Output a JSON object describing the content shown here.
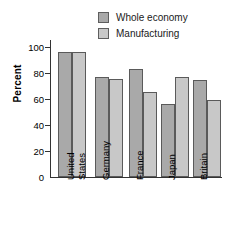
{
  "chart_data": {
    "type": "bar",
    "title": "",
    "xlabel": "",
    "ylabel": "Percent",
    "ylim": [
      0,
      110
    ],
    "yticks": [
      0,
      20,
      40,
      60,
      80,
      100
    ],
    "ytick_labels": [
      "0",
      "20",
      "40",
      "60",
      "80",
      "100"
    ],
    "grid": false,
    "legend_position": "top-right",
    "categories": [
      "United States",
      "Germany",
      "France",
      "Japan",
      "Britain"
    ],
    "category_label_lines": [
      [
        "United",
        "States"
      ],
      [
        "Germany"
      ],
      [
        "France"
      ],
      [
        "Japan"
      ],
      [
        "Britain"
      ]
    ],
    "series": [
      {
        "name": "Whole economy",
        "color": "#a9a9a9",
        "values": [
          100,
          80,
          87,
          59,
          77.5
        ]
      },
      {
        "name": "Manufacturing",
        "color": "#c8c8c8",
        "values": [
          100,
          78.5,
          68,
          80,
          62
        ]
      }
    ]
  }
}
